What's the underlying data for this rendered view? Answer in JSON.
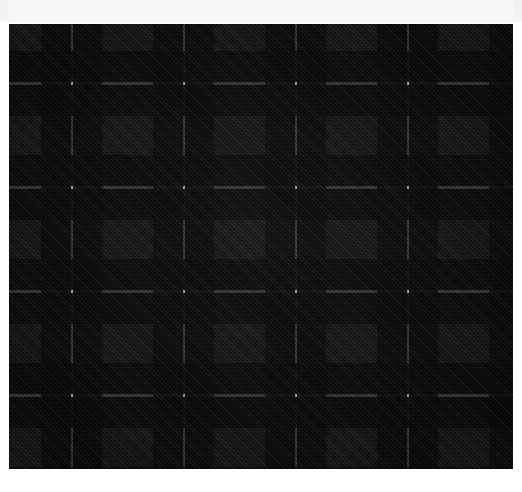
{
  "top_panel": {
    "caption": "",
    "background_color": "#f2f2f2"
  },
  "swatch": {
    "name": "tartan-fabric-swatch",
    "x": 9,
    "y": 24,
    "width": 504,
    "height": 445,
    "pattern_type": "tartan",
    "weave": "2/2 twill",
    "sett_width_px": 112,
    "sett_height_px": 104,
    "palette": {
      "charcoal_gray": "#3e3e3e",
      "black": "#0a0a0a",
      "deep_black": "#000000",
      "white_guard": "#d9d9d9",
      "light_guard": "#9a9a9a"
    },
    "warp_bands": [
      {
        "label": "charcoal",
        "color": "#3e3e3e",
        "start_pct": 0.0,
        "end_pct": 29.0
      },
      {
        "label": "black",
        "color": "#0a0a0a",
        "start_pct": 29.0,
        "end_pct": 55.0
      },
      {
        "label": "white-guard",
        "color": "#d9d9d9",
        "start_pct": 55.0,
        "end_pct": 57.2
      },
      {
        "label": "black",
        "color": "#0a0a0a",
        "start_pct": 57.2,
        "end_pct": 83.0
      },
      {
        "label": "charcoal",
        "color": "#3e3e3e",
        "start_pct": 83.0,
        "end_pct": 100.0
      }
    ],
    "weft_bands": [
      {
        "label": "charcoal",
        "color": "#3e3e3e",
        "start_pct": 0.0,
        "end_pct": 26.0
      },
      {
        "label": "black",
        "color": "#0a0a0a",
        "start_pct": 26.0,
        "end_pct": 56.0
      },
      {
        "label": "white-guard",
        "color": "#d9d9d9",
        "start_pct": 56.0,
        "end_pct": 58.5
      },
      {
        "label": "black",
        "color": "#0a0a0a",
        "start_pct": 58.5,
        "end_pct": 88.0
      },
      {
        "label": "charcoal",
        "color": "#3e3e3e",
        "start_pct": 88.0,
        "end_pct": 100.0
      }
    ]
  }
}
